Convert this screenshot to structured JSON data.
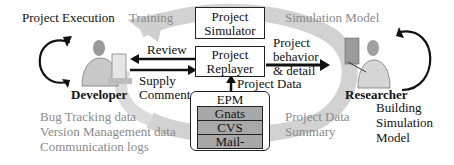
{
  "diagram": {
    "labels": {
      "project_execution": "Project Execution",
      "training": "Training",
      "simulation_model": "Simulation Model",
      "review": "Review",
      "supply": "Supply",
      "comment": "Comment",
      "developer": "Developer",
      "researcher": "Researcher",
      "project_behavior_1": "Project",
      "project_behavior_2": "behavior",
      "project_behavior_3": "& detail",
      "project_data": "Project Data",
      "project_data_summary_1": "Project Data",
      "project_data_summary_2": "Summary",
      "building_1": "Building",
      "building_2": "Simulation",
      "building_3": "Model"
    },
    "developer_sources": [
      "Bug Tracking data",
      "Version Management data",
      "Communication logs"
    ],
    "boxes": {
      "simulator_1": "Project",
      "simulator_2": "Simulator",
      "replayer_1": "Project",
      "replayer_2": "Replayer"
    },
    "epm": {
      "title": "EPM",
      "rows": [
        "Gnats",
        "CVS",
        "Mail-"
      ]
    },
    "colors": {
      "arc": "#cfcfcf",
      "gray_text": "#8a8a8a",
      "epm_row": "#a8a8a8",
      "line": "#111111"
    }
  }
}
